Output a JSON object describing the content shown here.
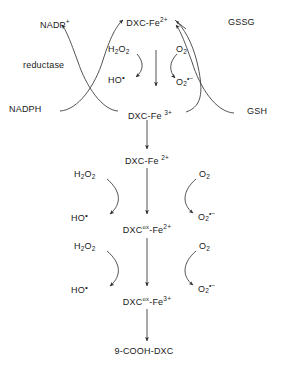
{
  "diagram": {
    "background_color": "#ffffff",
    "stroke_color": "#3a3a3a",
    "text_color": "#1a1a1a",
    "labels": {
      "nadp_plus": "NADP",
      "nadp_plus_sup": "+",
      "reductase": "reductase",
      "nadph": "NADPH",
      "gssg": "GSSG",
      "gsh": "GSH",
      "dxc_fe2_top": "DXC-Fe",
      "dxc_fe2_top_sup": "2+",
      "dxc_fe3_top": "DXC-Fe",
      "dxc_fe3_top_sup": "3+",
      "dxc_fe2_mid": "DXC-Fe",
      "dxc_fe2_mid_sup": "2+",
      "dxc_ox_fe2": "DXC",
      "dxc_ox_fe2_ox": "ox",
      "dxc_ox_fe2_tail": "-Fe",
      "dxc_ox_fe2_sup": "2+",
      "dxc_ox_fe3": "DXC",
      "dxc_ox_fe3_ox": "ox",
      "dxc_ox_fe3_tail": "-Fe",
      "dxc_ox_fe3_sup": "3+",
      "product": "9-COOH-DXC",
      "h2o2": "H",
      "h2o2_sub1": "2",
      "h2o2_mid": "O",
      "h2o2_sub2": "2",
      "hydroxyl": "HO",
      "hydroxyl_rad": "•",
      "o2": "O",
      "o2_sub": "2",
      "superoxide": "O",
      "superoxide_sub": "2",
      "superoxide_sup": "•−"
    },
    "nodes": [
      {
        "id": "nadp-plus",
        "text": "NADP+",
        "x": 40,
        "y": 22
      },
      {
        "id": "reductase",
        "text": "reductase",
        "x": 45,
        "y": 65
      },
      {
        "id": "nadph",
        "text": "NADPH",
        "x": 32,
        "y": 109
      },
      {
        "id": "gssg",
        "text": "GSSG",
        "x": 244,
        "y": 22
      },
      {
        "id": "gsh",
        "text": "GSH",
        "x": 254,
        "y": 111
      },
      {
        "id": "dxc-fe2-top",
        "text": "DXC-Fe2+",
        "x": 147,
        "y": 20
      },
      {
        "id": "dxc-fe3-top",
        "text": "DXC-Fe3+",
        "x": 147,
        "y": 112
      },
      {
        "id": "h2o2-top",
        "text": "H2O2",
        "x": 121,
        "y": 49
      },
      {
        "id": "ho-top",
        "text": "HO•",
        "x": 116,
        "y": 78
      },
      {
        "id": "o2-top",
        "text": "O2",
        "x": 182,
        "y": 49
      },
      {
        "id": "superoxide-top",
        "text": "O2•−",
        "x": 180,
        "y": 80
      },
      {
        "id": "dxc-fe2-mid",
        "text": "DXC-Fe2+",
        "x": 147,
        "y": 158
      },
      {
        "id": "h2o2-mid",
        "text": "H2O2",
        "x": 88,
        "y": 174
      },
      {
        "id": "ho-mid",
        "text": "HO•",
        "x": 80,
        "y": 216
      },
      {
        "id": "o2-mid",
        "text": "O2",
        "x": 205,
        "y": 174
      },
      {
        "id": "superoxide-mid",
        "text": "O2•−",
        "x": 203,
        "y": 215
      },
      {
        "id": "dxc-ox-fe2",
        "text": "DXCox-Fe2+",
        "x": 147,
        "y": 227
      },
      {
        "id": "h2o2-low",
        "text": "H2O2",
        "x": 88,
        "y": 246
      },
      {
        "id": "ho-low",
        "text": "HO•",
        "x": 80,
        "y": 288
      },
      {
        "id": "o2-low",
        "text": "O2",
        "x": 205,
        "y": 246
      },
      {
        "id": "superoxide-low",
        "text": "O2•−",
        "x": 203,
        "y": 287
      },
      {
        "id": "dxc-ox-fe3",
        "text": "DXCox-Fe3+",
        "x": 147,
        "y": 299
      },
      {
        "id": "product",
        "text": "9-COOH-DXC",
        "x": 144,
        "y": 351
      }
    ]
  }
}
